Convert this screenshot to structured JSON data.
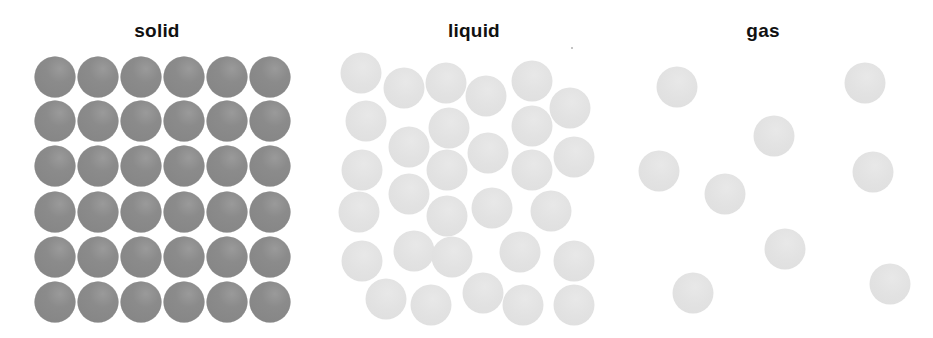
{
  "panels": [
    {
      "id": "solid",
      "title": "solid",
      "title_x": 157,
      "particle_color": "#888888",
      "particle_diameter": 41,
      "layout": "grid 6x6",
      "particles": [
        [
          55,
          77
        ],
        [
          98,
          77
        ],
        [
          141,
          77
        ],
        [
          184,
          77
        ],
        [
          227,
          77
        ],
        [
          270,
          77
        ],
        [
          55,
          121
        ],
        [
          98,
          121
        ],
        [
          141,
          121
        ],
        [
          184,
          121
        ],
        [
          227,
          121
        ],
        [
          270,
          121
        ],
        [
          55,
          166
        ],
        [
          98,
          166
        ],
        [
          141,
          166
        ],
        [
          184,
          166
        ],
        [
          227,
          166
        ],
        [
          270,
          166
        ],
        [
          55,
          212
        ],
        [
          98,
          212
        ],
        [
          141,
          212
        ],
        [
          184,
          212
        ],
        [
          227,
          212
        ],
        [
          270,
          212
        ],
        [
          55,
          257
        ],
        [
          98,
          257
        ],
        [
          141,
          257
        ],
        [
          184,
          257
        ],
        [
          227,
          257
        ],
        [
          270,
          257
        ],
        [
          55,
          302
        ],
        [
          98,
          302
        ],
        [
          141,
          302
        ],
        [
          184,
          302
        ],
        [
          227,
          302
        ],
        [
          270,
          302
        ]
      ]
    },
    {
      "id": "liquid",
      "title": "liquid",
      "title_x": 474,
      "particle_color": "#e2e2e2",
      "particle_diameter": 41,
      "layout": "random close-packed",
      "particles": [
        [
          361,
          73
        ],
        [
          404,
          88
        ],
        [
          446,
          83
        ],
        [
          486,
          96
        ],
        [
          532,
          81
        ],
        [
          570,
          108
        ],
        [
          366,
          121
        ],
        [
          449,
          128
        ],
        [
          409,
          147
        ],
        [
          532,
          126
        ],
        [
          488,
          153
        ],
        [
          574,
          157
        ],
        [
          362,
          170
        ],
        [
          447,
          170
        ],
        [
          532,
          170
        ],
        [
          409,
          194
        ],
        [
          359,
          212
        ],
        [
          447,
          216
        ],
        [
          492,
          208
        ],
        [
          551,
          211
        ],
        [
          414,
          251
        ],
        [
          362,
          261
        ],
        [
          452,
          257
        ],
        [
          520,
          252
        ],
        [
          574,
          261
        ],
        [
          386,
          299
        ],
        [
          431,
          305
        ],
        [
          483,
          293
        ],
        [
          523,
          305
        ],
        [
          574,
          305
        ]
      ]
    },
    {
      "id": "gas",
      "title": "gas",
      "title_x": 763,
      "particle_color": "#e2e2e2",
      "particle_diameter": 41,
      "layout": "random sparse",
      "particles": [
        [
          677,
          87
        ],
        [
          865,
          83
        ],
        [
          774,
          136
        ],
        [
          659,
          171
        ],
        [
          873,
          172
        ],
        [
          725,
          194
        ],
        [
          785,
          249
        ],
        [
          693,
          293
        ],
        [
          890,
          284
        ]
      ]
    }
  ],
  "artifacts": [
    [
      572,
      48
    ]
  ]
}
